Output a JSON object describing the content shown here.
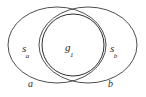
{
  "diagram": {
    "background_color": "#ffffff",
    "stroke_color": "#3a3a3a",
    "regions": {
      "left": {
        "name": "left-set-region",
        "label_base": "s",
        "label_sub": "a"
      },
      "center": {
        "name": "center-intersection-region",
        "label_base": "g",
        "label_sub": "1"
      },
      "right": {
        "name": "right-set-region",
        "label_base": "s",
        "label_sub": "b"
      }
    },
    "axis_labels": {
      "left": "a",
      "right": "b"
    },
    "shapes": [
      {
        "name": "outer-left-ellipse",
        "type": "ellipse",
        "cx": 57,
        "cy": 45,
        "rx": 49,
        "ry": 38
      },
      {
        "name": "outer-right-ellipse",
        "type": "ellipse",
        "cx": 88,
        "cy": 45,
        "rx": 49,
        "ry": 38
      },
      {
        "name": "center-circle",
        "type": "circle",
        "cx": 73,
        "cy": 45,
        "r": 31
      }
    ]
  }
}
